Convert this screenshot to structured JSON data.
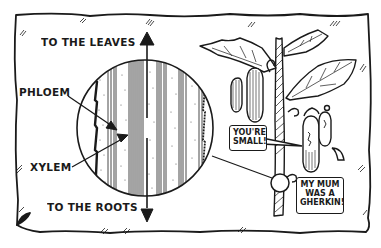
{
  "diagram": {
    "type": "illustration",
    "labels": {
      "top_arrow": "TO THE LEAVES",
      "bottom_arrow": "TO THE ROOTS",
      "phloem": "PHLOEM",
      "xylem": "XYLEM"
    },
    "speech_bubbles": [
      {
        "speaker": "large cucumber",
        "lines": [
          "YOU'RE",
          "SMALL!"
        ]
      },
      {
        "speaker": "small gherkin",
        "lines": [
          "MY MUM",
          "WAS A",
          "GHERKIN!"
        ]
      }
    ],
    "colors": {
      "ink": "#1a1a1a",
      "paper": "#ffffff"
    }
  }
}
